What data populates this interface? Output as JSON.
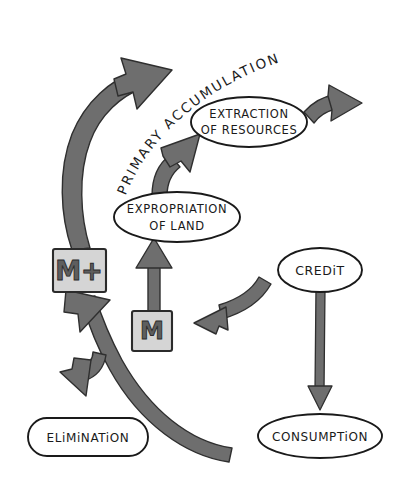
{
  "diagram": {
    "background_color": "#ffffff",
    "ink_color": "#1a1a1a",
    "arrow_fill": "#6e6e6e",
    "arrow_stroke": "#2f2f2f",
    "box_fill": "#d5d5d5",
    "box_glyph_fill": "#5e5e5e"
  },
  "arc_label": {
    "text": "PRIMARY ACCUMULATION",
    "letters": [
      "P",
      "R",
      "I",
      "M",
      "A",
      "R",
      "Y",
      " ",
      "A",
      "C",
      "C",
      "U",
      "M",
      "U",
      "L",
      "A",
      "T",
      "I",
      "O",
      "N"
    ]
  },
  "nodes": {
    "extraction": {
      "line1": "EXTRACTION",
      "line2": "OF RESOURCES",
      "shape": "ellipse",
      "fill": "#ffffff"
    },
    "expropriation": {
      "line1": "EXPROPRIATION",
      "line2": "OF LAND",
      "shape": "ellipse",
      "fill": "#ffffff"
    },
    "credit": {
      "line1": "CREDiT",
      "shape": "ellipse",
      "fill": "#ffffff"
    },
    "elimination": {
      "line1": "ELiMiNATiON",
      "shape": "stadium",
      "fill": "#ffffff"
    },
    "consumption": {
      "line1": "CONSUMPTiON",
      "shape": "ellipse",
      "fill": "#ffffff"
    },
    "m_plus": {
      "line1": "M+",
      "shape": "rectangle",
      "fill": "#d5d5d5"
    },
    "m": {
      "line1": "M",
      "shape": "rectangle",
      "fill": "#d5d5d5"
    }
  },
  "edges": [
    {
      "id": "mplus-to-accumulation",
      "from": "m_plus",
      "to": "primary-accumulation-arc",
      "style": "thick-curved",
      "direction": "up-right"
    },
    {
      "id": "expropriation-to-extraction",
      "from": "expropriation",
      "to": "extraction",
      "style": "thick-curved",
      "direction": "up-right"
    },
    {
      "id": "extraction-to-output",
      "from": "extraction",
      "to": "external-output",
      "style": "thick-curved",
      "direction": "right"
    },
    {
      "id": "m-to-expropriation",
      "from": "m",
      "to": "expropriation",
      "style": "straight",
      "direction": "up"
    },
    {
      "id": "credit-to-m",
      "from": "credit",
      "to": "m",
      "style": "thick-curved",
      "direction": "left"
    },
    {
      "id": "credit-to-consumption",
      "from": "credit",
      "to": "consumption",
      "style": "straight-thin",
      "direction": "down"
    },
    {
      "id": "consumption-to-mplus",
      "from": "consumption",
      "to": "m_plus",
      "style": "thick-curved-long",
      "direction": "up-left"
    },
    {
      "id": "mplus-branch-to-elimination",
      "from": "consumption-to-mplus",
      "to": "elimination",
      "style": "thick-curved-branch",
      "direction": "down-left"
    }
  ]
}
